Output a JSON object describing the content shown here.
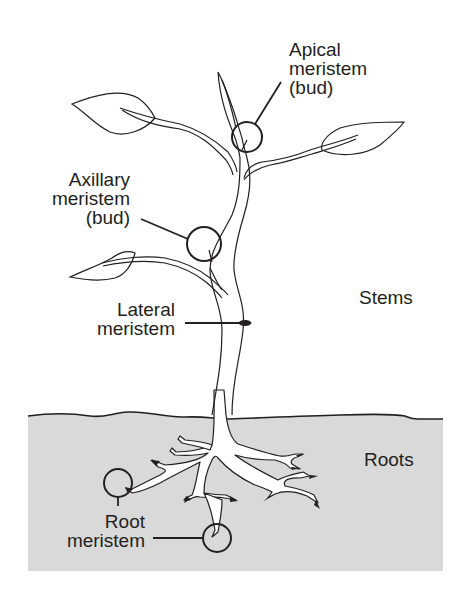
{
  "colors": {
    "ink": "#231f20",
    "soil": "#d9d9d9",
    "background": "#ffffff",
    "root_fill": "#ffffff"
  },
  "labels": {
    "apical": {
      "lines": [
        "Apical",
        "meristem",
        "(bud)"
      ]
    },
    "axillary": {
      "lines": [
        "Axillary",
        "meristem",
        "(bud)"
      ]
    },
    "lateral": {
      "lines": [
        "Lateral",
        "meristem"
      ]
    },
    "root": {
      "lines": [
        "Root",
        "meristem"
      ]
    },
    "stems": "Stems",
    "roots": "Roots"
  },
  "regions": [
    {
      "name": "Stems",
      "area": "above ground"
    },
    {
      "name": "Roots",
      "area": "below ground (soil)"
    }
  ],
  "callouts": [
    {
      "label": "Apical meristem (bud)",
      "marker": "circle"
    },
    {
      "label": "Axillary meristem (bud)",
      "marker": "circle"
    },
    {
      "label": "Lateral meristem",
      "marker": "ring on stem"
    },
    {
      "label": "Root meristem",
      "marker": "circle",
      "count": 2
    }
  ]
}
